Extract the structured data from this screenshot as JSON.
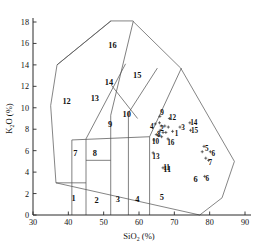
{
  "chart_data": {
    "type": "scatter",
    "title": "",
    "xlabel": "SiO2 (%)",
    "ylabel": "K2O (%)",
    "xlabel_main": "SiO",
    "xlabel_sub": "2",
    "xlabel_unit": "(%)",
    "ylabel_main": "K",
    "ylabel_sub": "2",
    "ylabel_rest": "O (%)",
    "xlim": [
      30,
      90
    ],
    "ylim": [
      0,
      18
    ],
    "xticks": [
      30,
      40,
      50,
      60,
      70,
      80,
      90
    ],
    "yticks": [
      0,
      2,
      4,
      6,
      8,
      10,
      12,
      14,
      16,
      18
    ],
    "grid": false,
    "legend": "none",
    "field_labels": [
      {
        "id": "1",
        "x": 41.5,
        "y": 1.6
      },
      {
        "id": "2",
        "x": 48.0,
        "y": 1.4
      },
      {
        "id": "3",
        "x": 54.0,
        "y": 1.5
      },
      {
        "id": "4",
        "x": 59.5,
        "y": 1.5
      },
      {
        "id": "5",
        "x": 66.5,
        "y": 1.7
      },
      {
        "id": "6",
        "x": 76.0,
        "y": 3.4
      },
      {
        "id": "7",
        "x": 42.0,
        "y": 5.8
      },
      {
        "id": "8",
        "x": 47.5,
        "y": 5.8
      },
      {
        "id": "9",
        "x": 51.8,
        "y": 8.5
      },
      {
        "id": "10",
        "x": 56.5,
        "y": 9.4
      },
      {
        "id": "11",
        "x": 68.0,
        "y": 4.3
      },
      {
        "id": "12",
        "x": 39.5,
        "y": 10.6
      },
      {
        "id": "13",
        "x": 47.5,
        "y": 10.9
      },
      {
        "id": "14",
        "x": 51.5,
        "y": 12.4
      },
      {
        "id": "15",
        "x": 59.5,
        "y": 13.1
      },
      {
        "id": "16",
        "x": 52.5,
        "y": 15.9
      }
    ],
    "point_labels": [
      {
        "id": "9",
        "x": 66.5,
        "y": 9.6
      },
      {
        "id": "12",
        "x": 69.5,
        "y": 9.1
      },
      {
        "id": "4",
        "x": 63.6,
        "y": 8.3
      },
      {
        "id": "2",
        "x": 66.5,
        "y": 8.1
      },
      {
        "id": "3",
        "x": 72.5,
        "y": 8.2
      },
      {
        "id": "14",
        "x": 75.5,
        "y": 8.6
      },
      {
        "id": "15",
        "x": 75.7,
        "y": 7.9
      },
      {
        "id": "1",
        "x": 70.6,
        "y": 7.6
      },
      {
        "id": "8",
        "x": 65.6,
        "y": 7.5
      },
      {
        "id": "10",
        "x": 64.7,
        "y": 6.9
      },
      {
        "id": "16",
        "x": 69.0,
        "y": 6.8
      },
      {
        "id": "13",
        "x": 64.8,
        "y": 5.5
      },
      {
        "id": "11",
        "x": 67.8,
        "y": 4.4
      },
      {
        "id": "5",
        "x": 79.2,
        "y": 6.2
      },
      {
        "id": "6",
        "x": 81.0,
        "y": 5.7
      },
      {
        "id": "7",
        "x": 80.2,
        "y": 4.9
      },
      {
        "id": "6b",
        "x": 79.3,
        "y": 3.4,
        "text": "6"
      }
    ],
    "data_points": [
      {
        "x": 65.9,
        "y": 9.2
      },
      {
        "x": 68.6,
        "y": 9.0
      },
      {
        "x": 64.6,
        "y": 8.5
      },
      {
        "x": 65.8,
        "y": 8.6
      },
      {
        "x": 66.3,
        "y": 8.3
      },
      {
        "x": 67.3,
        "y": 8.3
      },
      {
        "x": 68.3,
        "y": 8.2
      },
      {
        "x": 71.6,
        "y": 8.2
      },
      {
        "x": 74.4,
        "y": 8.6
      },
      {
        "x": 74.6,
        "y": 7.9
      },
      {
        "x": 69.5,
        "y": 7.8
      },
      {
        "x": 66.0,
        "y": 7.9
      },
      {
        "x": 66.8,
        "y": 7.7
      },
      {
        "x": 67.6,
        "y": 7.7
      },
      {
        "x": 64.9,
        "y": 7.5
      },
      {
        "x": 65.6,
        "y": 7.4
      },
      {
        "x": 66.4,
        "y": 7.3
      },
      {
        "x": 64.2,
        "y": 7.0
      },
      {
        "x": 68.2,
        "y": 7.1
      },
      {
        "x": 64.0,
        "y": 5.8
      },
      {
        "x": 66.8,
        "y": 4.4
      },
      {
        "x": 78.4,
        "y": 6.4
      },
      {
        "x": 77.9,
        "y": 5.9
      },
      {
        "x": 80.2,
        "y": 5.9
      },
      {
        "x": 78.9,
        "y": 5.3
      },
      {
        "x": 79.7,
        "y": 5.1
      },
      {
        "x": 78.6,
        "y": 3.6
      }
    ],
    "outer_polygon": [
      [
        36.5,
        3.0
      ],
      [
        35.0,
        10.2
      ],
      [
        36.8,
        14.0
      ],
      [
        52.0,
        18.1
      ],
      [
        58.2,
        18.1
      ],
      [
        71.8,
        13.7
      ],
      [
        87.0,
        5.0
      ],
      [
        83.5,
        1.6
      ],
      [
        77.2,
        0.0
      ]
    ],
    "boundary_paths": [
      "M 41.0 0.0 L 41.0 7.0",
      "M 45.0 0.0 L 45.0 7.1",
      "M 52.0 0.0 L 52.0 9.3",
      "M 57.0 0.0 L 57.0 9.5",
      "M 63.0 0.0 L 63.0 7.3",
      "M 36.5 3.0 L 45.0 3.0",
      "M 45.0 5.1 L 52.0 5.1",
      "M 41.0 7.0 L 63.0 7.3 L 72.0 13.7",
      "M 45.0 7.1 L 56.2 14.1",
      "M 52.0 9.3 L 58.4 18.1",
      "M 57.0 9.5 L 65.2 13.7",
      "M 52.2 12.1 L 59.6 9.0",
      "M 36.8 14.0 L 52.1 18.1"
    ]
  }
}
